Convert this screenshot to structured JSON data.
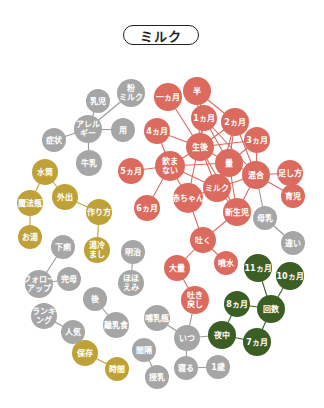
{
  "title": "ミルク",
  "colors": {
    "red": "#dc6a5e",
    "gray": "#a6a6a6",
    "gold": "#bfa237",
    "green": "#3b5e25",
    "edge_red": "#dc6a5e",
    "edge_gray": "#9a9a9a",
    "edge_gold": "#bfa237",
    "edge_green": "#3b5e25"
  },
  "nodes": [
    {
      "id": "ichikagetsu",
      "lines": [
        "一ヵ月"
      ],
      "x": 168,
      "y": 97,
      "r": 14,
      "group": "red"
    },
    {
      "id": "han",
      "lines": [
        "半"
      ],
      "x": 197,
      "y": 91,
      "r": 14,
      "group": "red"
    },
    {
      "id": "1kagetsu",
      "lines": [
        "1ヵ月"
      ],
      "x": 204,
      "y": 118,
      "r": 13,
      "group": "red"
    },
    {
      "id": "2kagetsu",
      "lines": [
        "2ヵ月"
      ],
      "x": 235,
      "y": 122,
      "r": 14,
      "group": "red"
    },
    {
      "id": "4kagetsu",
      "lines": [
        "4ヵ月"
      ],
      "x": 157,
      "y": 131,
      "r": 13,
      "group": "red"
    },
    {
      "id": "3kagetsu",
      "lines": [
        "3ヵ月"
      ],
      "x": 257,
      "y": 140,
      "r": 13,
      "group": "red"
    },
    {
      "id": "seigo",
      "lines": [
        "生後"
      ],
      "x": 200,
      "y": 147,
      "r": 14,
      "group": "red"
    },
    {
      "id": "nomanai",
      "lines": [
        "飲ま",
        "ない"
      ],
      "x": 170,
      "y": 166,
      "r": 15,
      "group": "red"
    },
    {
      "id": "ryo",
      "lines": [
        "量"
      ],
      "x": 229,
      "y": 163,
      "r": 14,
      "group": "red"
    },
    {
      "id": "5kagetsu",
      "lines": [
        "5ヵ月"
      ],
      "x": 131,
      "y": 171,
      "r": 13,
      "group": "red"
    },
    {
      "id": "kongo",
      "lines": [
        "混合"
      ],
      "x": 256,
      "y": 175,
      "r": 14,
      "group": "red"
    },
    {
      "id": "tashikata",
      "lines": [
        "足し方"
      ],
      "x": 290,
      "y": 173,
      "r": 13,
      "group": "red"
    },
    {
      "id": "milk",
      "lines": [
        "ミルク"
      ],
      "x": 217,
      "y": 188,
      "r": 14,
      "group": "red"
    },
    {
      "id": "akachan",
      "lines": [
        "赤ちゃん"
      ],
      "x": 188,
      "y": 198,
      "r": 15,
      "group": "red"
    },
    {
      "id": "ikuji",
      "lines": [
        "育児"
      ],
      "x": 293,
      "y": 196,
      "r": 12,
      "group": "red"
    },
    {
      "id": "6kagetsu",
      "lines": [
        "6ヵ月"
      ],
      "x": 147,
      "y": 208,
      "r": 13,
      "group": "red"
    },
    {
      "id": "shinseiji",
      "lines": [
        "新生児"
      ],
      "x": 237,
      "y": 212,
      "r": 14,
      "group": "red"
    },
    {
      "id": "haku",
      "lines": [
        "吐く"
      ],
      "x": 203,
      "y": 240,
      "r": 13,
      "group": "red"
    },
    {
      "id": "funsui",
      "lines": [
        "噴水"
      ],
      "x": 226,
      "y": 263,
      "r": 12,
      "group": "red"
    },
    {
      "id": "tairyo",
      "lines": [
        "大量"
      ],
      "x": 177,
      "y": 268,
      "r": 13,
      "group": "red"
    },
    {
      "id": "hakimodoshi",
      "lines": [
        "吐き",
        "戻し"
      ],
      "x": 195,
      "y": 300,
      "r": 14,
      "group": "red"
    },
    {
      "id": "nyuji",
      "lines": [
        "乳児"
      ],
      "x": 98,
      "y": 101,
      "r": 12,
      "group": "gray"
    },
    {
      "id": "konamilk",
      "lines": [
        "粉",
        "ミルク"
      ],
      "x": 131,
      "y": 93,
      "r": 14,
      "group": "gray"
    },
    {
      "id": "allergy",
      "lines": [
        "アレル",
        "ギー"
      ],
      "x": 88,
      "y": 129,
      "r": 14,
      "group": "gray"
    },
    {
      "id": "yo",
      "lines": [
        "用"
      ],
      "x": 123,
      "y": 130,
      "r": 12,
      "group": "gray"
    },
    {
      "id": "shojo",
      "lines": [
        "症状"
      ],
      "x": 54,
      "y": 140,
      "r": 12,
      "group": "gray"
    },
    {
      "id": "gyunyu",
      "lines": [
        "牛乳"
      ],
      "x": 89,
      "y": 163,
      "r": 13,
      "group": "gray"
    },
    {
      "id": "bonyu",
      "lines": [
        "母乳"
      ],
      "x": 265,
      "y": 218,
      "r": 12,
      "group": "gray"
    },
    {
      "id": "chigai",
      "lines": [
        "違い"
      ],
      "x": 293,
      "y": 243,
      "r": 12,
      "group": "gray"
    },
    {
      "id": "meiji",
      "lines": [
        "明治"
      ],
      "x": 133,
      "y": 252,
      "r": 12,
      "group": "gray"
    },
    {
      "id": "hohoemi",
      "lines": [
        "ほほ",
        "えみ"
      ],
      "x": 131,
      "y": 283,
      "r": 13,
      "group": "gray"
    },
    {
      "id": "kaso",
      "lines": [
        "下痢"
      ],
      "x": 63,
      "y": 247,
      "r": 12,
      "group": "gray"
    },
    {
      "id": "kanbo",
      "lines": [
        "完母"
      ],
      "x": 69,
      "y": 279,
      "r": 12,
      "group": "gray"
    },
    {
      "id": "followup",
      "lines": [
        "フォロー",
        "アップ"
      ],
      "x": 39,
      "y": 284,
      "r": 14,
      "group": "gray"
    },
    {
      "id": "go",
      "lines": [
        "後"
      ],
      "x": 95,
      "y": 299,
      "r": 12,
      "group": "gray"
    },
    {
      "id": "ranking",
      "lines": [
        "ランキ",
        "ング"
      ],
      "x": 44,
      "y": 316,
      "r": 13,
      "group": "gray"
    },
    {
      "id": "rinyushoku",
      "lines": [
        "離乳食"
      ],
      "x": 116,
      "y": 325,
      "r": 13,
      "group": "gray"
    },
    {
      "id": "ninki",
      "lines": [
        "人気"
      ],
      "x": 73,
      "y": 332,
      "r": 12,
      "group": "gray"
    },
    {
      "id": "honyubin",
      "lines": [
        "哺乳瓶"
      ],
      "x": 157,
      "y": 318,
      "r": 13,
      "group": "gray"
    },
    {
      "id": "itsu",
      "lines": [
        "いつ"
      ],
      "x": 187,
      "y": 338,
      "r": 13,
      "group": "gray"
    },
    {
      "id": "kankaku",
      "lines": [
        "間隔"
      ],
      "x": 144,
      "y": 350,
      "r": 12,
      "group": "gray"
    },
    {
      "id": "neru",
      "lines": [
        "寝る"
      ],
      "x": 186,
      "y": 368,
      "r": 12,
      "group": "gray"
    },
    {
      "id": "1sai",
      "lines": [
        "1歳"
      ],
      "x": 218,
      "y": 367,
      "r": 12,
      "group": "gray"
    },
    {
      "id": "junyu",
      "lines": [
        "授乳"
      ],
      "x": 157,
      "y": 377,
      "r": 12,
      "group": "gray"
    },
    {
      "id": "suito",
      "lines": [
        "水筒"
      ],
      "x": 45,
      "y": 172,
      "r": 13,
      "group": "gold"
    },
    {
      "id": "gaishutsu",
      "lines": [
        "外出"
      ],
      "x": 65,
      "y": 197,
      "r": 13,
      "group": "gold"
    },
    {
      "id": "mahobin",
      "lines": [
        "魔法瓶"
      ],
      "x": 30,
      "y": 203,
      "r": 13,
      "group": "gold"
    },
    {
      "id": "tsukurikata",
      "lines": [
        "作り方"
      ],
      "x": 99,
      "y": 212,
      "r": 13,
      "group": "gold"
    },
    {
      "id": "oyu",
      "lines": [
        "お湯"
      ],
      "x": 30,
      "y": 237,
      "r": 12,
      "group": "gold"
    },
    {
      "id": "yuzamashi",
      "lines": [
        "湯冷",
        "まし"
      ],
      "x": 97,
      "y": 250,
      "r": 13,
      "group": "gold"
    },
    {
      "id": "hozon",
      "lines": [
        "保存"
      ],
      "x": 85,
      "y": 353,
      "r": 13,
      "group": "gold"
    },
    {
      "id": "jikan",
      "lines": [
        "時間"
      ],
      "x": 117,
      "y": 369,
      "r": 12,
      "group": "gold"
    },
    {
      "id": "11kagetsu",
      "lines": [
        "11ヵ月"
      ],
      "x": 258,
      "y": 268,
      "r": 14,
      "group": "green"
    },
    {
      "id": "10kagetsu",
      "lines": [
        "10ヵ月"
      ],
      "x": 290,
      "y": 276,
      "r": 14,
      "group": "green"
    },
    {
      "id": "8kagetsu",
      "lines": [
        "8ヵ月"
      ],
      "x": 237,
      "y": 304,
      "r": 13,
      "group": "green"
    },
    {
      "id": "kaisu",
      "lines": [
        "回数"
      ],
      "x": 271,
      "y": 309,
      "r": 14,
      "group": "green"
    },
    {
      "id": "yachu",
      "lines": [
        "夜中"
      ],
      "x": 222,
      "y": 335,
      "r": 14,
      "group": "green"
    },
    {
      "id": "7kagetsu",
      "lines": [
        "7ヵ月"
      ],
      "x": 257,
      "y": 342,
      "r": 14,
      "group": "green"
    }
  ],
  "edges": [
    [
      "ichikagetsu",
      "seigo",
      "red"
    ],
    [
      "han",
      "1kagetsu",
      "red"
    ],
    [
      "han",
      "2kagetsu",
      "red"
    ],
    [
      "han",
      "seigo",
      "red"
    ],
    [
      "1kagetsu",
      "ryo",
      "red"
    ],
    [
      "1kagetsu",
      "kongo",
      "red"
    ],
    [
      "1kagetsu",
      "seigo",
      "red"
    ],
    [
      "1kagetsu",
      "akachan",
      "red"
    ],
    [
      "2kagetsu",
      "seigo",
      "red"
    ],
    [
      "2kagetsu",
      "kongo",
      "red"
    ],
    [
      "2kagetsu",
      "ryo",
      "red"
    ],
    [
      "2kagetsu",
      "milk",
      "red"
    ],
    [
      "3kagetsu",
      "seigo",
      "red"
    ],
    [
      "3kagetsu",
      "kongo",
      "red"
    ],
    [
      "3kagetsu",
      "ryo",
      "red"
    ],
    [
      "4kagetsu",
      "seigo",
      "red"
    ],
    [
      "4kagetsu",
      "nomanai",
      "red"
    ],
    [
      "seigo",
      "nomanai",
      "red"
    ],
    [
      "seigo",
      "ryo",
      "red"
    ],
    [
      "seigo",
      "shinseiji",
      "red"
    ],
    [
      "seigo",
      "milk",
      "red"
    ],
    [
      "nomanai",
      "5kagetsu",
      "red"
    ],
    [
      "nomanai",
      "6kagetsu",
      "red"
    ],
    [
      "nomanai",
      "milk",
      "red"
    ],
    [
      "nomanai",
      "akachan",
      "red"
    ],
    [
      "nomanai",
      "ryo",
      "red"
    ],
    [
      "ryo",
      "kongo",
      "red"
    ],
    [
      "ryo",
      "milk",
      "red"
    ],
    [
      "ryo",
      "shinseiji",
      "red"
    ],
    [
      "kongo",
      "tashikata",
      "red"
    ],
    [
      "kongo",
      "ikuji",
      "red"
    ],
    [
      "kongo",
      "milk",
      "red"
    ],
    [
      "kongo",
      "shinseiji",
      "red"
    ],
    [
      "kongo",
      "bonyu",
      "gray"
    ],
    [
      "milk",
      "akachan",
      "red"
    ],
    [
      "milk",
      "shinseiji",
      "red"
    ],
    [
      "akachan",
      "haku",
      "red"
    ],
    [
      "shinseiji",
      "haku",
      "red"
    ],
    [
      "haku",
      "funsui",
      "red"
    ],
    [
      "haku",
      "tairyo",
      "red"
    ],
    [
      "tairyo",
      "hakimodoshi",
      "red"
    ],
    [
      "hakimodoshi",
      "itsu",
      "gray"
    ],
    [
      "nyuji",
      "allergy",
      "gray"
    ],
    [
      "konamilk",
      "allergy",
      "gray"
    ],
    [
      "allergy",
      "yo",
      "gray"
    ],
    [
      "allergy",
      "shojo",
      "gray"
    ],
    [
      "allergy",
      "gyunyu",
      "gray"
    ],
    [
      "bonyu",
      "chigai",
      "gray"
    ],
    [
      "meiji",
      "hohoemi",
      "gray"
    ],
    [
      "kaso",
      "followup",
      "gray"
    ],
    [
      "followup",
      "kanbo",
      "gray"
    ],
    [
      "go",
      "rinyushoku",
      "gray"
    ],
    [
      "ranking",
      "ninki",
      "gray"
    ],
    [
      "honyubin",
      "itsu",
      "gray"
    ],
    [
      "itsu",
      "neru",
      "gray"
    ],
    [
      "itsu",
      "yachu",
      "gray"
    ],
    [
      "neru",
      "1sai",
      "gray"
    ],
    [
      "kankaku",
      "junyu",
      "gray"
    ],
    [
      "suito",
      "gaishutsu",
      "gold"
    ],
    [
      "suito",
      "mahobin",
      "gold"
    ],
    [
      "gaishutsu",
      "tsukurikata",
      "gold"
    ],
    [
      "mahobin",
      "oyu",
      "gold"
    ],
    [
      "tsukurikata",
      "yuzamashi",
      "gold"
    ],
    [
      "ninki",
      "hozon",
      "gray"
    ],
    [
      "hozon",
      "jikan",
      "gold"
    ],
    [
      "11kagetsu",
      "kaisu",
      "green"
    ],
    [
      "10kagetsu",
      "kaisu",
      "green"
    ],
    [
      "8kagetsu",
      "kaisu",
      "green"
    ],
    [
      "8kagetsu",
      "yachu",
      "green"
    ],
    [
      "yachu",
      "7kagetsu",
      "green"
    ],
    [
      "kaisu",
      "7kagetsu",
      "green"
    ]
  ]
}
